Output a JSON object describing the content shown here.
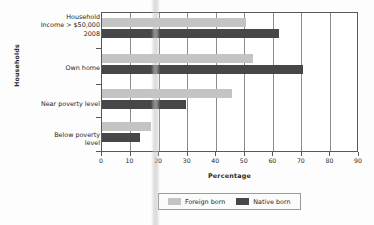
{
  "chart_data": {
    "type": "bar",
    "orientation": "horizontal",
    "title": "",
    "xlabel": "Percentage",
    "ylabel": "Households",
    "xlim": [
      0,
      90
    ],
    "xticks": [
      0,
      10,
      20,
      30,
      40,
      50,
      60,
      70,
      80,
      90
    ],
    "grid": "vertical",
    "legend_position": "bottom",
    "categories": [
      "Household\nIncome > $50,000\n2008",
      "Own home",
      "Near poverty level",
      "Below poverty\nlevel"
    ],
    "category_lines": [
      [
        "Household",
        "Income > $50,000",
        "2008"
      ],
      [
        "Own home"
      ],
      [
        "Near poverty level"
      ],
      [
        "Below poverty",
        "level"
      ]
    ],
    "series": [
      {
        "name": "Foreign born",
        "color": "#c4c4c4",
        "values": [
          50.4,
          53.0,
          45.6,
          17.3
        ]
      },
      {
        "name": "Native born",
        "color": "#474749",
        "values": [
          62.1,
          70.3,
          29.5,
          13.4
        ]
      }
    ]
  },
  "axis": {
    "x_title": "Percentage",
    "y_title": "Households",
    "tick_labels": [
      "0",
      "10",
      "20",
      "30",
      "40",
      "50",
      "60",
      "70",
      "80",
      "90"
    ]
  },
  "categories": [
    {
      "line1": "Household",
      "line2": "Income > $50,000",
      "line3": "2008"
    },
    {
      "line1": "Own home",
      "line2": "",
      "line3": ""
    },
    {
      "line1": "Near poverty level",
      "line2": "",
      "line3": ""
    },
    {
      "line1": "Below poverty",
      "line2": "level",
      "line3": ""
    }
  ],
  "legend": {
    "items": [
      {
        "label": "Foreign born",
        "color": "#c4c4c4"
      },
      {
        "label": "Native born",
        "color": "#474749"
      }
    ]
  }
}
